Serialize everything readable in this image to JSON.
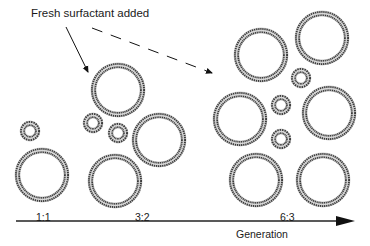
{
  "title": "Fresh surfactant added",
  "axis": {
    "label": "Generation",
    "stages": [
      {
        "ratio": "1:1"
      },
      {
        "ratio": "3:2"
      },
      {
        "ratio": "6:3"
      }
    ]
  },
  "colors": {
    "ring": "#6a6a6a",
    "ring_dark": "#3a3a3a",
    "arrow": "#111111",
    "text": "#1a1a1a"
  },
  "vesicles": {
    "stage_1": {
      "large": [
        {
          "cx": 42,
          "cy": 175,
          "r": 27
        }
      ],
      "small": [
        {
          "cx": 30,
          "cy": 131,
          "r": 10
        }
      ]
    },
    "stage_2": {
      "large": [
        {
          "cx": 118,
          "cy": 90,
          "r": 27
        },
        {
          "cx": 159,
          "cy": 140,
          "r": 27
        },
        {
          "cx": 115,
          "cy": 181,
          "r": 27
        }
      ],
      "small": [
        {
          "cx": 93,
          "cy": 123,
          "r": 10
        },
        {
          "cx": 118,
          "cy": 133,
          "r": 10
        }
      ]
    },
    "stage_3": {
      "large": [
        {
          "cx": 261,
          "cy": 55,
          "r": 27
        },
        {
          "cx": 322,
          "cy": 38,
          "r": 27
        },
        {
          "cx": 240,
          "cy": 119,
          "r": 27
        },
        {
          "cx": 329,
          "cy": 113,
          "r": 27
        },
        {
          "cx": 256,
          "cy": 180,
          "r": 27
        },
        {
          "cx": 323,
          "cy": 180,
          "r": 27
        }
      ],
      "small": [
        {
          "cx": 301,
          "cy": 78,
          "r": 10
        },
        {
          "cx": 281,
          "cy": 105,
          "r": 10
        },
        {
          "cx": 281,
          "cy": 139,
          "r": 10
        }
      ]
    }
  }
}
